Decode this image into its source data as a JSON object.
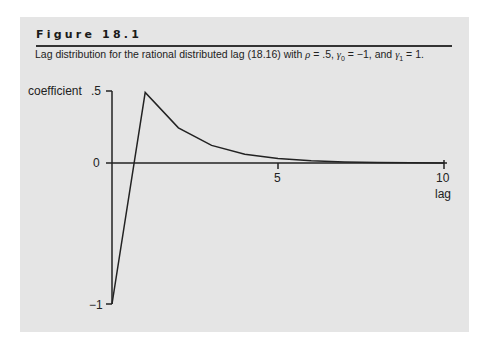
{
  "figure": {
    "title": "Figure 18.1",
    "caption_prefix": "Lag distribution for the rational distributed lag (18.16) with ",
    "caption_rho": "ρ",
    "caption_rho_val": " = .5, ",
    "caption_g0": "γ",
    "caption_g0_sub": "0",
    "caption_g0_val": " = −1, and ",
    "caption_g1": "γ",
    "caption_g1_sub": "1",
    "caption_g1_val": " = 1."
  },
  "chart_data": {
    "type": "line",
    "title": "Figure 18.1",
    "subtitle": "Lag distribution for the rational distributed lag (18.16) with ρ = .5, γ0 = −1, and γ1 = 1.",
    "xlabel": "lag",
    "ylabel": "coefficient",
    "x": [
      0,
      1,
      2,
      3,
      4,
      5,
      6,
      7,
      8,
      9,
      10
    ],
    "values": [
      -1,
      0.5,
      0.25,
      0.125,
      0.0625,
      0.03125,
      0.015625,
      0.0078125,
      0.00390625,
      0.001953125,
      0.0009765625
    ],
    "xlim": [
      0,
      10
    ],
    "ylim": [
      -1,
      0.5
    ],
    "x_ticks": [
      "5",
      "10"
    ],
    "y_ticks": [
      ".5",
      "0",
      "−1"
    ],
    "grid": false,
    "legend": null
  },
  "axis": {
    "ylabel": "coefficient",
    "xlabel": "lag",
    "ytick_top": ".5",
    "ytick_zero": "0",
    "ytick_bottom": "−1",
    "xtick_5": "5",
    "xtick_10": "10"
  }
}
